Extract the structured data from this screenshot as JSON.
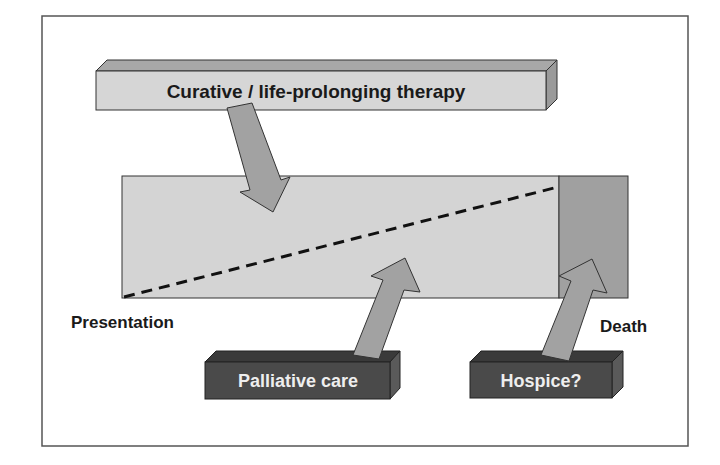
{
  "diagram": {
    "title_box": {
      "label": "Curative / life-prolonging therapy"
    },
    "timeline": {
      "start_label": "Presentation",
      "end_label": "Death"
    },
    "bottom_boxes": [
      {
        "label": "Palliative care"
      },
      {
        "label": "Hospice?"
      }
    ],
    "colors": {
      "frame": "#555555",
      "light_box": "#d6d6d6",
      "light_box_top": "#a8a8a8",
      "light_box_side": "#9a9a9a",
      "timeline_fill": "#d4d4d4",
      "hospice_region": "#a0a0a0",
      "arrow": "#a2a2a2",
      "dark_box": "#4a4a4a",
      "dark_box_top": "#3a3a3a",
      "dark_box_side": "#5a5a5a",
      "dashed_line": "#111111",
      "dark_text": "#1a1a1a",
      "light_text": "#eeeeee"
    }
  }
}
